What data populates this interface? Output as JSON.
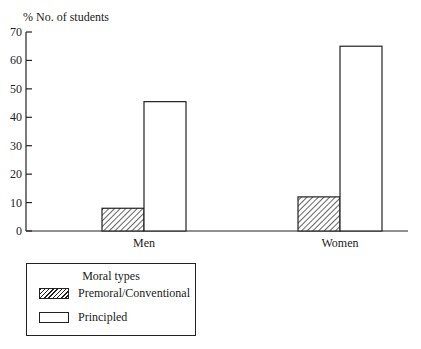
{
  "chart_data": {
    "type": "bar",
    "title": "",
    "xlabel": "",
    "ylabel": "% No. of students",
    "ylim": [
      0,
      70
    ],
    "yticks": [
      0,
      10,
      20,
      30,
      40,
      50,
      60,
      70
    ],
    "categories": [
      "Men",
      "Women"
    ],
    "series": [
      {
        "name": "Premoral/Conventional",
        "fill": "hatched",
        "values": [
          8,
          12
        ]
      },
      {
        "name": "Principled",
        "fill": "white",
        "values": [
          45.5,
          65
        ]
      }
    ],
    "grid": false,
    "legend": {
      "title": "Moral types",
      "position": "bottom-left"
    }
  },
  "axis": {
    "ylabel": "% No. of students",
    "yticks": [
      "0",
      "10",
      "20",
      "30",
      "40",
      "50",
      "60",
      "70"
    ]
  },
  "categories": [
    "Men",
    "Women"
  ],
  "legend": {
    "title": "Moral types",
    "items": [
      {
        "label": "Premoral/Conventional",
        "swatch": "hatched"
      },
      {
        "label": "Principled",
        "swatch": "white"
      }
    ]
  },
  "colors": {
    "ink": "#222222",
    "background": "#ffffff"
  }
}
